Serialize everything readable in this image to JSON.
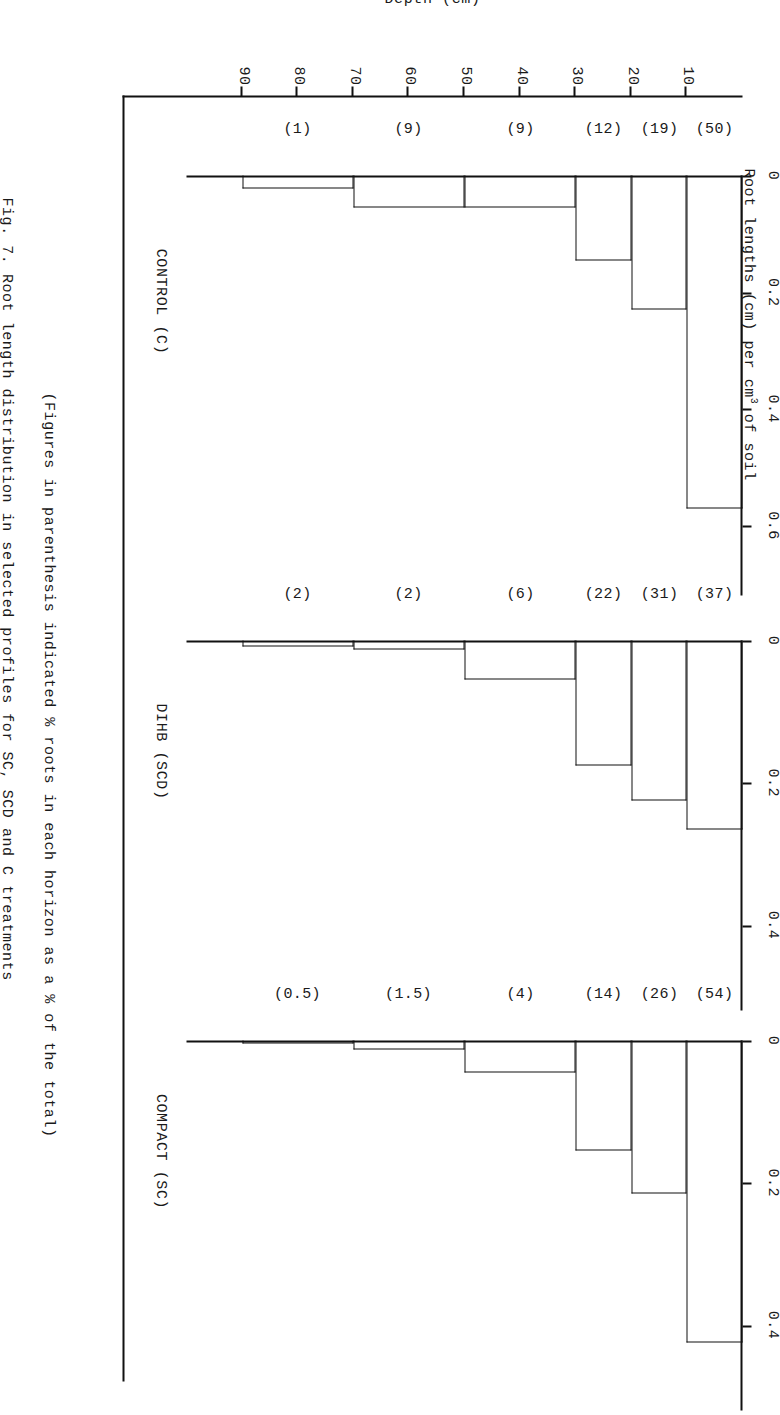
{
  "chart_title": "Root lengths (cm) per cm3 of soil",
  "chart_title_parts": {
    "before": "Root lengths (cm) per cm",
    "sup": "3",
    "after": " of soil"
  },
  "paren_note": "(Figures in parenthesis indicated % roots in each horizon as a % of the total)",
  "fig_caption": "Fig. 7.  Root length distribution in selected profiles for SC, SCD and C treatments",
  "depth_axis": {
    "title": "Depth (cm)",
    "unit": "cm",
    "ticks": [
      10,
      20,
      30,
      40,
      50,
      60,
      70,
      80,
      90
    ],
    "min": 0,
    "max": 100
  },
  "chart_data": {
    "type": "bar",
    "orientation": "horizontal",
    "title": "Root lengths (cm) per cm3 of soil",
    "xlabel": "Root lengths (cm) per cm3 of soil",
    "ylabel": "Depth (cm)",
    "ylim": [
      0,
      100
    ],
    "note": "(Figures in parenthesis indicated % roots in each horizon as a % of the total)",
    "panels": [
      {
        "name": "CONTROL  (C)",
        "label": "CONTROL",
        "code": "(C)",
        "xticks": [
          "0",
          "0.2",
          "0.4",
          "0.6"
        ],
        "xtick_values": [
          0,
          0.2,
          0.4,
          0.6
        ],
        "xlim": [
          0,
          0.72
        ],
        "horizons": [
          {
            "depth_top": 0,
            "depth_bottom": 10,
            "value": 0.57,
            "percent": "(50)"
          },
          {
            "depth_top": 10,
            "depth_bottom": 20,
            "value": 0.23,
            "percent": "(19)"
          },
          {
            "depth_top": 20,
            "depth_bottom": 30,
            "value": 0.145,
            "percent": "(12)"
          },
          {
            "depth_top": 30,
            "depth_bottom": 50,
            "value": 0.055,
            "percent": "(9)"
          },
          {
            "depth_top": 50,
            "depth_bottom": 70,
            "value": 0.055,
            "percent": "(9)"
          },
          {
            "depth_top": 70,
            "depth_bottom": 90,
            "value": 0.022,
            "percent": "(1)"
          }
        ]
      },
      {
        "name": "DIHB  (SCD)",
        "label": "DIHB",
        "code": "(SCD)",
        "xticks": [
          "0",
          "0.2",
          "0.4"
        ],
        "xtick_values": [
          0,
          0.2,
          0.4
        ],
        "xlim": [
          0,
          0.52
        ],
        "horizons": [
          {
            "depth_top": 0,
            "depth_bottom": 10,
            "value": 0.265,
            "percent": "(37)"
          },
          {
            "depth_top": 10,
            "depth_bottom": 20,
            "value": 0.225,
            "percent": "(31)"
          },
          {
            "depth_top": 20,
            "depth_bottom": 30,
            "value": 0.175,
            "percent": "(22)"
          },
          {
            "depth_top": 30,
            "depth_bottom": 50,
            "value": 0.055,
            "percent": "(6)"
          },
          {
            "depth_top": 50,
            "depth_bottom": 70,
            "value": 0.012,
            "percent": "(2)"
          },
          {
            "depth_top": 70,
            "depth_bottom": 90,
            "value": 0.008,
            "percent": "(2)"
          }
        ]
      },
      {
        "name": "COMPACT  (SC)",
        "label": "COMPACT",
        "code": "(SC)",
        "xticks": [
          "0",
          "0.2",
          "0.4"
        ],
        "xtick_values": [
          0,
          0.2,
          0.4
        ],
        "xlim": [
          0,
          0.52
        ],
        "horizons": [
          {
            "depth_top": 0,
            "depth_bottom": 10,
            "value": 0.425,
            "percent": "(54)"
          },
          {
            "depth_top": 10,
            "depth_bottom": 20,
            "value": 0.215,
            "percent": "(26)"
          },
          {
            "depth_top": 20,
            "depth_bottom": 30,
            "value": 0.155,
            "percent": "(14)"
          },
          {
            "depth_top": 30,
            "depth_bottom": 50,
            "value": 0.045,
            "percent": "(4)"
          },
          {
            "depth_top": 50,
            "depth_bottom": 70,
            "value": 0.012,
            "percent": "(1.5)"
          },
          {
            "depth_top": 70,
            "depth_bottom": 90,
            "value": 0.004,
            "percent": "(0.5)"
          }
        ]
      }
    ]
  },
  "panel_positions": [
    80,
    545,
    945
  ],
  "panel_widths": [
    420,
    370,
    370
  ]
}
